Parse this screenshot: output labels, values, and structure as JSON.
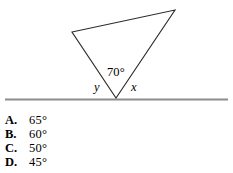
{
  "figure": {
    "labels": {
      "apex_angle": "70°",
      "left_exterior_angle": "y",
      "right_exterior_angle": "x"
    },
    "colors": {
      "triangle_stroke": "#2b2b2b",
      "baseline_stroke": "#8c8c8c",
      "background": "#ffffff"
    },
    "geometry": {
      "triangle_vertices": [
        [
          72,
          32
        ],
        [
          175,
          10
        ],
        [
          116,
          98
        ]
      ],
      "baseline_start": [
        5,
        99
      ],
      "baseline_end": [
        228,
        99
      ]
    }
  },
  "choices": [
    {
      "letter": "A.",
      "value": "65°"
    },
    {
      "letter": "B.",
      "value": "60°"
    },
    {
      "letter": "C.",
      "value": "50°"
    },
    {
      "letter": "D.",
      "value": "45°"
    }
  ]
}
